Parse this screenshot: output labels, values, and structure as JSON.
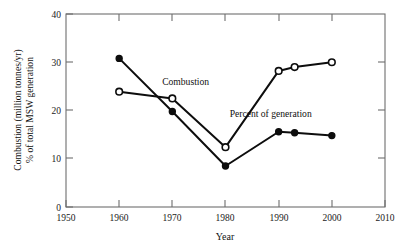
{
  "chart_data": {
    "type": "line",
    "title": "",
    "xlabel": "Year",
    "ylabel_line1": "Combustion (million tonnes/yr)",
    "ylabel_line2": "% of total MSW generation",
    "xlim": [
      1950,
      2010
    ],
    "ylim": [
      0,
      40
    ],
    "xticks": [
      1950,
      1960,
      1970,
      1980,
      1990,
      2000,
      2010
    ],
    "yticks": [
      0,
      10,
      20,
      30,
      40
    ],
    "grid": false,
    "legend_position": "inline-annotations",
    "series": [
      {
        "name": "Combustion",
        "marker": "open-circle",
        "annotation": "Combustion",
        "x": [
          1960,
          1970,
          1980,
          1990,
          1993,
          2000
        ],
        "values": [
          23.9,
          22.5,
          12.4,
          28.2,
          29.0,
          30.0
        ]
      },
      {
        "name": "Percent of generation",
        "marker": "filled-circle",
        "annotation": "Percent of generation",
        "x": [
          1960,
          1970,
          1980,
          1990,
          1993,
          2000
        ],
        "values": [
          30.8,
          19.8,
          8.5,
          15.6,
          15.4,
          14.8
        ]
      }
    ],
    "annotations": [
      {
        "text": "Combustion",
        "x": 1972.5,
        "y": 25.2
      },
      {
        "text": "Percent of generation",
        "x": 1988.5,
        "y": 18.6
      }
    ]
  },
  "axis": {
    "x_tick_labels": [
      "1950",
      "1960",
      "1970",
      "1980",
      "1990",
      "2000",
      "2010"
    ],
    "y_tick_labels": [
      "0",
      "10",
      "20",
      "30",
      "40"
    ],
    "x_title": "Year",
    "y_title_line1": "Combustion (million tonnes/yr)",
    "y_title_line2": "% of total MSW generation"
  },
  "colors": {
    "ink": "#0d0d0d",
    "frame": "#6e6e6e",
    "background": "#ffffff"
  }
}
